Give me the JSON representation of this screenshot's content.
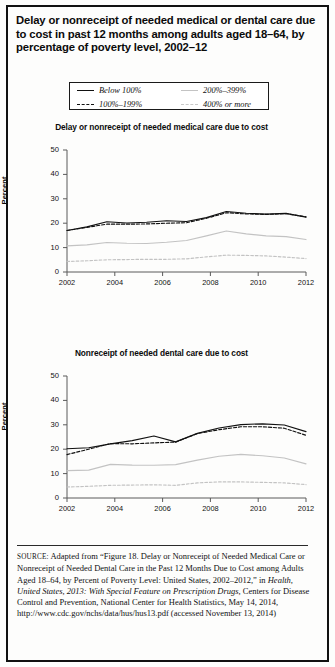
{
  "figure": {
    "title": "Delay or nonreceipt of needed medical or dental care due to cost in past 12 months among adults aged 18–64, by percentage of poverty level, 2002–12"
  },
  "legend": {
    "position": "top-center",
    "items": [
      {
        "label": "Below 100%",
        "style": "solid-dark",
        "swatch": "sw-solid-dark"
      },
      {
        "label": "200%–399%",
        "style": "solid-light",
        "swatch": "sw-solid-light"
      },
      {
        "label": "100%–199%",
        "style": "dashed-dark",
        "swatch": "sw-dash-dark"
      },
      {
        "label": "400% or more",
        "style": "dashed-light",
        "swatch": "sw-dash-light"
      }
    ]
  },
  "colors": {
    "dark_line": "#111111",
    "light_line": "#c3c3c3",
    "axis": "#5a5a5a",
    "frame": "#111111",
    "background": "#fdfdfc"
  },
  "chart_data": [
    {
      "type": "line",
      "title": "Delay or nonreceipt of needed medical care due to cost",
      "xlabel": "",
      "ylabel": "Percent",
      "x": [
        2002,
        2003,
        2004,
        2005,
        2006,
        2007,
        2008,
        2009,
        2010,
        2011,
        2012
      ],
      "xtick_labels": [
        "2002",
        "2004",
        "2006",
        "2008",
        "2010",
        "2012"
      ],
      "xtick_values": [
        2002,
        2004,
        2006,
        2008,
        2010,
        2012
      ],
      "xlim": [
        2002,
        2012
      ],
      "ylim": [
        0,
        50
      ],
      "ytick_labels": [
        "0",
        "10",
        "20",
        "30",
        "40",
        "50"
      ],
      "ytick_values": [
        0,
        10,
        20,
        30,
        40,
        50
      ],
      "grid": false,
      "series": [
        {
          "name": "Below 100%",
          "style": "solid-dark",
          "values": [
            17.0,
            18.5,
            20.6,
            20.1,
            20.4,
            21.0,
            20.7,
            22.3,
            24.8,
            24.1,
            23.7,
            24.0,
            22.5
          ]
        },
        {
          "name": "100%–199%",
          "style": "dashed-dark",
          "values": [
            17.0,
            18.3,
            19.6,
            19.6,
            19.7,
            20.0,
            20.2,
            22.0,
            24.3,
            23.8,
            23.6,
            23.9,
            22.6
          ]
        },
        {
          "name": "200%–399%",
          "style": "solid-light",
          "values": [
            10.7,
            11.1,
            12.1,
            11.8,
            11.7,
            12.2,
            12.9,
            14.8,
            16.8,
            15.6,
            14.8,
            14.5,
            13.3
          ]
        },
        {
          "name": "400% or more",
          "style": "dashed-light",
          "values": [
            4.3,
            4.6,
            5.0,
            5.1,
            5.2,
            5.2,
            5.4,
            6.2,
            6.9,
            6.8,
            6.6,
            6.1,
            5.5
          ]
        }
      ]
    },
    {
      "type": "line",
      "title": "Nonreceipt of needed dental care due to cost",
      "xlabel": "",
      "ylabel": "Percent",
      "x": [
        2002,
        2003,
        2004,
        2005,
        2006,
        2007,
        2008,
        2009,
        2010,
        2011,
        2012
      ],
      "xtick_labels": [
        "2002",
        "2004",
        "2006",
        "2008",
        "2010",
        "2012"
      ],
      "xtick_values": [
        2002,
        2004,
        2006,
        2008,
        2010,
        2012
      ],
      "xlim": [
        2002,
        2012
      ],
      "ylim": [
        0,
        50
      ],
      "ytick_labels": [
        "0",
        "10",
        "20",
        "30",
        "40",
        "50"
      ],
      "ytick_values": [
        0,
        10,
        20,
        30,
        40,
        50
      ],
      "grid": false,
      "series": [
        {
          "name": "Below 100%",
          "style": "solid-dark",
          "values": [
            20.2,
            20.6,
            22.2,
            23.5,
            25.4,
            23.0,
            26.5,
            28.7,
            30.1,
            30.4,
            29.9,
            27.2
          ]
        },
        {
          "name": "100%–199%",
          "style": "dashed-dark",
          "values": [
            17.8,
            20.0,
            22.3,
            22.2,
            22.6,
            22.9,
            26.4,
            28.0,
            29.2,
            29.2,
            28.6,
            25.7
          ]
        },
        {
          "name": "200%–399%",
          "style": "solid-light",
          "values": [
            11.2,
            11.4,
            13.8,
            13.5,
            13.4,
            13.7,
            15.5,
            17.1,
            17.9,
            17.3,
            16.4,
            14.0
          ]
        },
        {
          "name": "400% or more",
          "style": "dashed-light",
          "values": [
            4.5,
            4.8,
            5.2,
            5.3,
            5.4,
            5.2,
            6.2,
            6.6,
            6.6,
            6.4,
            6.2,
            5.5
          ]
        }
      ]
    }
  ],
  "source": {
    "label": "SOURCE:",
    "line1": " Adapted from “Figure 18. Delay or Nonreceipt of Needed Medical Care or Nonreceipt of Needed Dental Care in the Past 12 Months Due to Cost among Adults Aged 18–64, by Percent of Poverty Level: United States, 2002–2012,” in ",
    "italic_title": "Health, United States, 2013: With Special Feature on Prescription Drugs",
    "line2": ", Centers for Disease Control and Prevention, National Center for Health Statistics, May 14, 2014, http://www.cdc.gov/nchs/data/hus/hus13.pdf (accessed November 13, 2014)"
  }
}
